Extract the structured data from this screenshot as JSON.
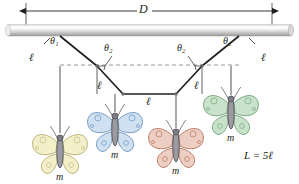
{
  "figure": {
    "type": "physics-diagram"
  },
  "labels": {
    "span": "D",
    "theta1": "θ₁",
    "theta2": "θ₂",
    "segment": "ℓ",
    "mass": "m",
    "total_length": "L = 5ℓ"
  },
  "geometry": {
    "rod": {
      "x1": 8,
      "x2": 291,
      "y": 30,
      "thickness": 11
    },
    "dimension_line": {
      "x1": 26,
      "x2": 272,
      "y": 11
    },
    "dashed_line": {
      "x1": 60,
      "x2": 239,
      "y": 65
    },
    "attach_left": {
      "x": 60,
      "y": 36
    },
    "attach_right": {
      "x": 239,
      "y": 36
    },
    "node1": {
      "x": 97,
      "y": 66
    },
    "node2": {
      "x": 123,
      "y": 94
    },
    "node3": {
      "x": 176,
      "y": 94
    },
    "node4": {
      "x": 202,
      "y": 66
    },
    "segment_count": 5
  },
  "butterflies": [
    {
      "name": "yellow-butterfly",
      "cx": 60,
      "cy": 152,
      "wing": "#f2efc9",
      "stroke": "#b5ad72",
      "spot": "#d8d19a",
      "drop_from_y": 66,
      "drop_x": 60,
      "label_y": 176
    },
    {
      "name": "blue-butterfly",
      "cx": 115,
      "cy": 130,
      "wing": "#cfe0f0",
      "stroke": "#6b93bd",
      "spot": "#9dbcd9",
      "drop_from_y": 94,
      "drop_x": 115,
      "label_y": 154
    },
    {
      "name": "red-butterfly",
      "cx": 176,
      "cy": 146,
      "wing": "#eccfc2",
      "stroke": "#b8705a",
      "spot": "#d9a18c",
      "drop_from_y": 94,
      "drop_x": 176,
      "label_y": 170
    },
    {
      "name": "green-butterfly",
      "cx": 231,
      "cy": 113,
      "wing": "#c9e2cb",
      "stroke": "#6fa177",
      "spot": "#9cc6a2",
      "drop_from_y": 66,
      "drop_x": 231,
      "label_y": 137
    }
  ],
  "label_positions": {
    "span": {
      "x": 143,
      "y": 3
    },
    "theta1_left": {
      "x": 48,
      "y": 38
    },
    "theta1_right": {
      "x": 226,
      "y": 38
    },
    "l_upper_left": {
      "x": 31,
      "y": 57
    },
    "l_upper_right": {
      "x": 259,
      "y": 57
    },
    "theta2_left": {
      "x": 104,
      "y": 48
    },
    "theta2_right": {
      "x": 179,
      "y": 48
    },
    "l_mid_left": {
      "x": 97,
      "y": 86
    },
    "l_mid_right": {
      "x": 193,
      "y": 86
    },
    "l_center": {
      "x": 146,
      "y": 100
    },
    "total": {
      "x": 249,
      "y": 156
    }
  },
  "colors": {
    "line": "#231f20",
    "dashed": "#8a8a8a",
    "rod_light": "#ffffff",
    "rod_mid": "#d6d6d6",
    "rod_dark": "#a8a8a8",
    "body": "#6e6e72",
    "text": "#231f20"
  }
}
